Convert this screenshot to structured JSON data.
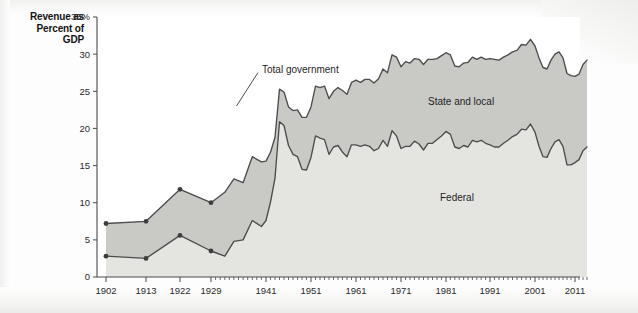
{
  "title_lines": [
    "Revenue as",
    "Percent of",
    "GDP"
  ],
  "colors": {
    "state_local_fill": "#c9c9c6",
    "federal_fill": "#e4e4e1",
    "line": "#4c4c4c",
    "axis": "#4a4a4a",
    "text": "#1f1f1f",
    "page_background": "#fdfdfd"
  },
  "annotations": {
    "total_government": "Total government",
    "state_and_local": "State and local",
    "federal": "Federal"
  },
  "chart_data": {
    "type": "area",
    "stacked": true,
    "title": "Revenue as Percent of GDP",
    "xlabel": "",
    "ylabel": "Revenue as Percent of GDP",
    "ylim": [
      0,
      35
    ],
    "yticks": [
      0,
      5,
      10,
      15,
      20,
      25,
      30,
      35
    ],
    "ytick_labels": [
      "0",
      "5",
      "10",
      "15",
      "20",
      "25",
      "30",
      "35%"
    ],
    "xlim": [
      1902,
      2014
    ],
    "xticks": [
      1902,
      1913,
      1922,
      1929,
      1941,
      1951,
      1961,
      1971,
      1981,
      1991,
      2001,
      2011
    ],
    "xtick_labels": [
      "1902",
      "1913",
      "1922",
      "1929",
      "1941",
      "1951",
      "1961",
      "1971",
      "1981",
      "1991",
      "2001",
      "2011"
    ],
    "grid": false,
    "legend_position": "inline-annotations",
    "marked_points_years": [
      1902,
      1913,
      1922,
      1929
    ],
    "series": [
      {
        "name": "Federal",
        "fill": "#e4e4e1",
        "x": [
          1902,
          1913,
          1922,
          1929,
          1932,
          1934,
          1936,
          1938,
          1940,
          1941,
          1942,
          1943,
          1944,
          1945,
          1946,
          1947,
          1948,
          1949,
          1950,
          1951,
          1952,
          1953,
          1954,
          1955,
          1956,
          1957,
          1958,
          1959,
          1960,
          1961,
          1962,
          1963,
          1964,
          1965,
          1966,
          1967,
          1968,
          1969,
          1970,
          1971,
          1972,
          1973,
          1974,
          1975,
          1976,
          1977,
          1978,
          1979,
          1980,
          1981,
          1982,
          1983,
          1984,
          1985,
          1986,
          1987,
          1988,
          1989,
          1990,
          1991,
          1992,
          1993,
          1994,
          1995,
          1996,
          1997,
          1998,
          1999,
          2000,
          2001,
          2002,
          2003,
          2004,
          2005,
          2006,
          2007,
          2008,
          2009,
          2010,
          2011,
          2012,
          2013,
          2014
        ],
        "values": [
          2.8,
          2.5,
          5.6,
          3.5,
          2.8,
          4.8,
          5.0,
          7.6,
          6.8,
          7.6,
          10.1,
          13.3,
          20.9,
          20.4,
          17.7,
          16.5,
          16.2,
          14.5,
          14.4,
          16.1,
          19.0,
          18.7,
          18.5,
          16.5,
          17.5,
          17.7,
          16.8,
          16.2,
          17.8,
          17.8,
          17.6,
          17.8,
          17.6,
          17.0,
          17.3,
          18.4,
          17.6,
          19.7,
          19.0,
          17.3,
          17.6,
          17.6,
          18.3,
          17.9,
          17.1,
          18.0,
          18.0,
          18.5,
          19.0,
          19.6,
          19.2,
          17.5,
          17.3,
          17.7,
          17.5,
          18.4,
          18.2,
          18.4,
          18.0,
          17.8,
          17.5,
          17.5,
          18.0,
          18.4,
          18.9,
          19.2,
          19.9,
          19.8,
          20.6,
          19.5,
          17.6,
          16.2,
          16.1,
          17.3,
          18.2,
          18.5,
          17.6,
          15.1,
          15.1,
          15.4,
          15.8,
          17.0,
          17.5
        ]
      },
      {
        "name": "State and local",
        "fill": "#c9c9c6",
        "note": "plotted as the band between Federal and Total government",
        "x": [
          1902,
          1913,
          1922,
          1929,
          1932,
          1934,
          1936,
          1938,
          1940,
          1941,
          1942,
          1943,
          1944,
          1945,
          1946,
          1947,
          1948,
          1949,
          1950,
          1951,
          1952,
          1953,
          1954,
          1955,
          1956,
          1957,
          1958,
          1959,
          1960,
          1961,
          1962,
          1963,
          1964,
          1965,
          1966,
          1967,
          1968,
          1969,
          1970,
          1971,
          1972,
          1973,
          1974,
          1975,
          1976,
          1977,
          1978,
          1979,
          1980,
          1981,
          1982,
          1983,
          1984,
          1985,
          1986,
          1987,
          1988,
          1989,
          1990,
          1991,
          1992,
          1993,
          1994,
          1995,
          1996,
          1997,
          1998,
          1999,
          2000,
          2001,
          2002,
          2003,
          2004,
          2005,
          2006,
          2007,
          2008,
          2009,
          2010,
          2011,
          2012,
          2013,
          2014
        ],
        "values": [
          4.4,
          5.0,
          6.2,
          6.5,
          8.6,
          8.4,
          7.7,
          8.6,
          8.7,
          8.0,
          6.7,
          5.5,
          4.4,
          4.5,
          5.2,
          5.9,
          6.3,
          7.0,
          7.1,
          6.8,
          6.7,
          6.8,
          7.2,
          7.5,
          7.5,
          7.8,
          8.3,
          8.4,
          8.4,
          8.7,
          8.6,
          8.8,
          9.0,
          9.1,
          9.4,
          9.6,
          9.9,
          10.2,
          10.6,
          11.0,
          11.4,
          11.2,
          11.1,
          11.4,
          11.5,
          11.3,
          11.3,
          10.9,
          10.8,
          10.6,
          10.7,
          10.9,
          11.0,
          11.1,
          11.4,
          11.2,
          11.1,
          11.2,
          11.3,
          11.6,
          11.8,
          11.7,
          11.6,
          11.5,
          11.4,
          11.3,
          11.4,
          11.4,
          11.4,
          11.6,
          11.9,
          12.0,
          11.9,
          11.9,
          11.8,
          11.8,
          11.9,
          12.3,
          12.0,
          11.6,
          11.5,
          11.6,
          11.7
        ]
      },
      {
        "name": "Total government",
        "note": "sum of Federal and State and local; upper boundary line",
        "x": [
          1902,
          1913,
          1922,
          1929,
          1932,
          1934,
          1936,
          1938,
          1940,
          1941,
          1942,
          1943,
          1944,
          1945,
          1946,
          1947,
          1948,
          1949,
          1950,
          1951,
          1952,
          1953,
          1954,
          1955,
          1956,
          1957,
          1958,
          1959,
          1960,
          1961,
          1962,
          1963,
          1964,
          1965,
          1966,
          1967,
          1968,
          1969,
          1970,
          1971,
          1972,
          1973,
          1974,
          1975,
          1976,
          1977,
          1978,
          1979,
          1980,
          1981,
          1982,
          1983,
          1984,
          1985,
          1986,
          1987,
          1988,
          1989,
          1990,
          1991,
          1992,
          1993,
          1994,
          1995,
          1996,
          1997,
          1998,
          1999,
          2000,
          2001,
          2002,
          2003,
          2004,
          2005,
          2006,
          2007,
          2008,
          2009,
          2010,
          2011,
          2012,
          2013,
          2014
        ],
        "values": [
          7.2,
          7.5,
          11.8,
          10.0,
          11.4,
          13.2,
          12.7,
          16.2,
          15.5,
          15.6,
          16.8,
          18.8,
          25.3,
          24.9,
          22.9,
          22.4,
          22.5,
          21.5,
          21.5,
          22.9,
          25.7,
          25.5,
          25.7,
          24.0,
          25.0,
          25.5,
          25.1,
          24.6,
          26.2,
          26.5,
          26.2,
          26.6,
          26.6,
          26.1,
          26.7,
          28.0,
          27.5,
          29.9,
          29.6,
          28.3,
          29.0,
          28.8,
          29.4,
          29.3,
          28.6,
          29.3,
          29.3,
          29.4,
          29.8,
          30.2,
          29.9,
          28.4,
          28.3,
          28.8,
          28.9,
          29.6,
          29.3,
          29.6,
          29.3,
          29.4,
          29.3,
          29.2,
          29.6,
          29.9,
          30.3,
          30.5,
          31.3,
          31.2,
          32.0,
          31.1,
          29.5,
          28.2,
          28.0,
          29.2,
          30.0,
          30.3,
          29.5,
          27.4,
          27.1,
          27.0,
          27.3,
          28.6,
          29.2
        ]
      }
    ]
  }
}
